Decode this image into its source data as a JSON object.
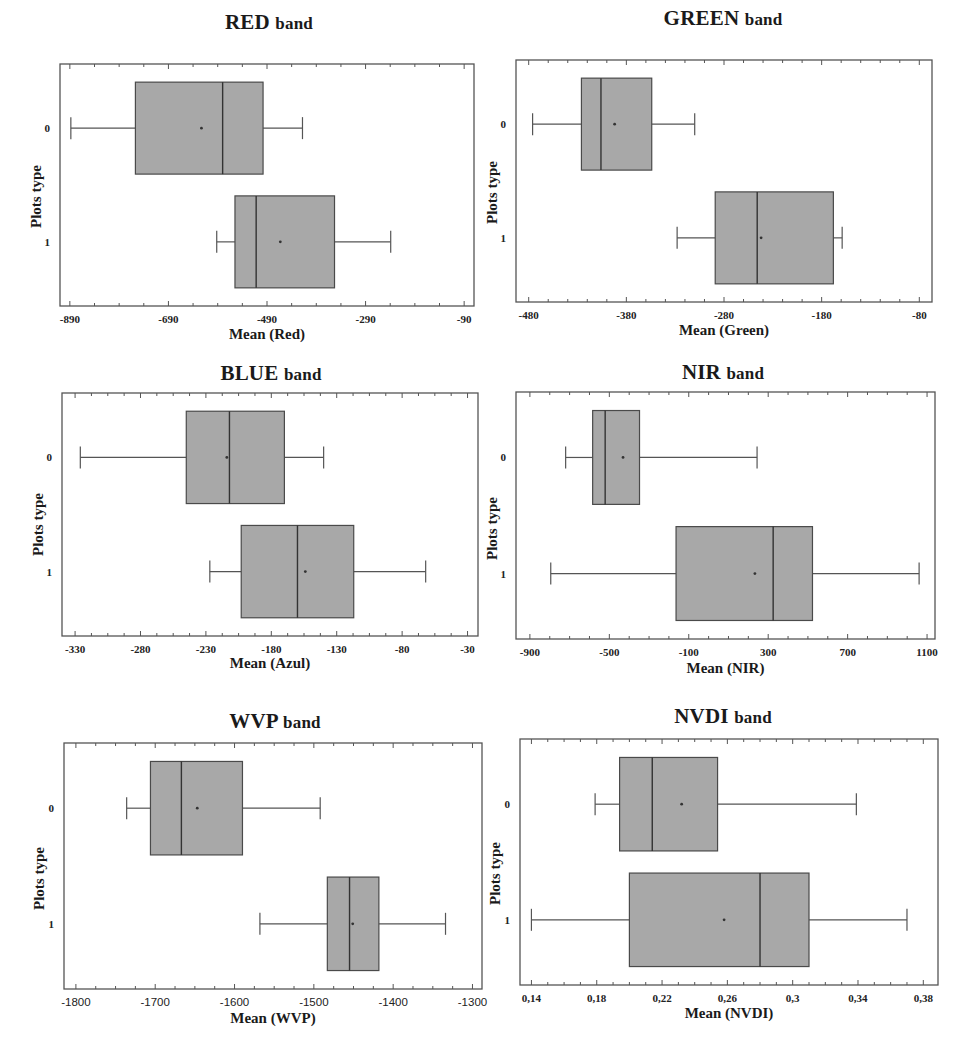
{
  "chart_data": [
    {
      "type": "boxplot",
      "orientation": "horizontal",
      "title": "RED band",
      "title_main": "RED",
      "title_suffix": "band",
      "xlabel": "Mean (Red)",
      "ylabel": "Plots type",
      "xlim": [
        -910,
        -70
      ],
      "xticks": [
        -890,
        -690,
        -490,
        -290,
        -90
      ],
      "xtick_labels": [
        "-890",
        "-690",
        "-490",
        "-290",
        "-90"
      ],
      "minor_ticks_per_major": 4,
      "categories": [
        "0",
        "1"
      ],
      "series": [
        {
          "category": "0",
          "min": -888,
          "q1": -757,
          "median": -580,
          "q3": -498,
          "max": -418,
          "mean": -623
        },
        {
          "category": "1",
          "min": -592,
          "q1": -555,
          "median": -512,
          "q3": -353,
          "max": -239,
          "mean": -463
        }
      ],
      "grid": false,
      "box_color": "#a8a8a8"
    },
    {
      "type": "boxplot",
      "orientation": "horizontal",
      "title": "GREEN band",
      "title_main": "GREEN",
      "title_suffix": "band",
      "xlabel": "Mean (Green)",
      "ylabel": "Plots type",
      "xlim": [
        -493,
        -67
      ],
      "xticks": [
        -480,
        -380,
        -280,
        -180,
        -80
      ],
      "xtick_labels": [
        "-480",
        "-380",
        "-280",
        "-180",
        "-80"
      ],
      "minor_ticks_per_major": 5,
      "categories": [
        "0",
        "1"
      ],
      "series": [
        {
          "category": "0",
          "min": -476,
          "q1": -426,
          "median": -406,
          "q3": -354,
          "max": -310,
          "mean": -392
        },
        {
          "category": "1",
          "min": -328,
          "q1": -289,
          "median": -246,
          "q3": -168,
          "max": -159,
          "mean": -242
        }
      ],
      "grid": false,
      "box_color": "#a8a8a8"
    },
    {
      "type": "boxplot",
      "orientation": "horizontal",
      "title": "BLUE band",
      "title_main": "BLUE",
      "title_suffix": "band",
      "xlabel": "Mean (Azul)",
      "ylabel": "Plots type",
      "xlim": [
        -340,
        -22
      ],
      "xticks": [
        -330,
        -280,
        -230,
        -180,
        -130,
        -80,
        -30
      ],
      "xtick_labels": [
        "-330",
        "-280",
        "-230",
        "-180",
        "-130",
        "-80",
        "-30"
      ],
      "minor_ticks_per_major": 4,
      "categories": [
        "0",
        "1"
      ],
      "series": [
        {
          "category": "0",
          "min": -326,
          "q1": -245,
          "median": -212,
          "q3": -170,
          "max": -140,
          "mean": -214
        },
        {
          "category": "1",
          "min": -227,
          "q1": -203,
          "median": -160,
          "q3": -117,
          "max": -62,
          "mean": -154
        }
      ],
      "grid": false,
      "box_color": "#a8a8a8"
    },
    {
      "type": "boxplot",
      "orientation": "horizontal",
      "title": "NIR band",
      "title_main": "NIR",
      "title_suffix": "band",
      "xlabel": "Mean (NIR)",
      "ylabel": "Plots type",
      "xlim": [
        -970,
        1140
      ],
      "xticks": [
        -900,
        -500,
        -100,
        300,
        700,
        1100
      ],
      "xtick_labels": [
        "-900",
        "-500",
        "-100",
        "300",
        "700",
        "1100"
      ],
      "minor_ticks_per_major": 4,
      "categories": [
        "0",
        "1"
      ],
      "series": [
        {
          "category": "0",
          "min": -720,
          "q1": -584,
          "median": -521,
          "q3": -348,
          "max": 244,
          "mean": -431
        },
        {
          "category": "1",
          "min": -795,
          "q1": -164,
          "median": 325,
          "q3": 523,
          "max": 1060,
          "mean": 233
        }
      ],
      "grid": false,
      "box_color": "#a8a8a8"
    },
    {
      "type": "boxplot",
      "orientation": "horizontal",
      "title": "WVP band",
      "title_main": "WVP",
      "title_suffix": "band",
      "xlabel": "Mean (WVP)",
      "ylabel": "Plots type",
      "xlim": [
        -1815,
        -1288
      ],
      "xticks": [
        -1800,
        -1700,
        -1600,
        -1500,
        -1400,
        -1300
      ],
      "xtick_labels": [
        "-1800",
        "-1700",
        "-1600",
        "-1500",
        "-1400",
        "-1300"
      ],
      "minor_ticks_per_major": 4,
      "categories": [
        "0",
        "1"
      ],
      "series": [
        {
          "category": "0",
          "min": -1736,
          "q1": -1706,
          "median": -1667,
          "q3": -1590,
          "max": -1492,
          "mean": -1647
        },
        {
          "category": "1",
          "min": -1568,
          "q1": -1483,
          "median": -1455,
          "q3": -1418,
          "max": -1334,
          "mean": -1451
        }
      ],
      "grid": false,
      "box_color": "#a8a8a8"
    },
    {
      "type": "boxplot",
      "orientation": "horizontal",
      "title": "NVDI band",
      "title_main": "NVDI",
      "title_suffix": "band",
      "xlabel": "Mean (NVDI)",
      "ylabel": "Plots type",
      "xlim": [
        0.133,
        0.389
      ],
      "xticks": [
        0.14,
        0.18,
        0.22,
        0.26,
        0.3,
        0.34,
        0.38
      ],
      "xtick_labels": [
        "0,14",
        "0,18",
        "0,22",
        "0,26",
        "0,3",
        "0,34",
        "0,38"
      ],
      "minor_ticks_per_major": 4,
      "categories": [
        "0",
        "1"
      ],
      "series": [
        {
          "category": "0",
          "min": 0.179,
          "q1": 0.194,
          "median": 0.214,
          "q3": 0.254,
          "max": 0.339,
          "mean": 0.232
        },
        {
          "category": "1",
          "min": 0.14,
          "q1": 0.2,
          "median": 0.28,
          "q3": 0.31,
          "max": 0.37,
          "mean": 0.258
        }
      ],
      "grid": false,
      "box_color": "#a8a8a8"
    }
  ]
}
